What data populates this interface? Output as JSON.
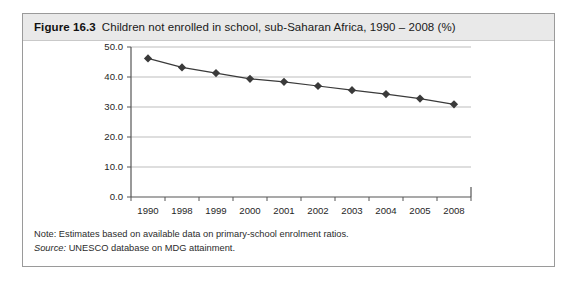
{
  "figure": {
    "number": "Figure 16.3",
    "title": "Children not enrolled in school, sub-Saharan Africa, 1990 – 2008 (%)",
    "note": "Note: Estimates based on available data on primary-school enrolment ratios.",
    "source_label": "Source:",
    "source_text": "UNESCO database on MDG attainment."
  },
  "colors": {
    "caption_band": "#e9e9e9",
    "border": "#9a9a9a",
    "gridline": "#b5b5b5",
    "axis": "#555555",
    "series": "#3a3a3a"
  },
  "chart_data": {
    "type": "line",
    "title": "Children not enrolled in school, sub-Saharan Africa, 1990 – 2008 (%)",
    "xlabel": "",
    "ylabel": "",
    "categories": [
      "1990",
      "1998",
      "1999",
      "2000",
      "2001",
      "2002",
      "2003",
      "2004",
      "2005",
      "2008"
    ],
    "series": [
      {
        "name": "Children not enrolled in school (%)",
        "values": [
          46.2,
          43.2,
          41.3,
          39.4,
          38.4,
          37.0,
          35.6,
          34.3,
          32.8,
          30.9
        ]
      }
    ],
    "ylim": [
      0.0,
      50.0
    ],
    "ytick_labels": [
      "0.0",
      "10.0",
      "20.0",
      "30.0",
      "40.0",
      "50.0"
    ],
    "ytick_values": [
      0.0,
      10.0,
      20.0,
      30.0,
      40.0,
      50.0
    ],
    "grid": true,
    "legend": "none",
    "marker": "diamond"
  }
}
